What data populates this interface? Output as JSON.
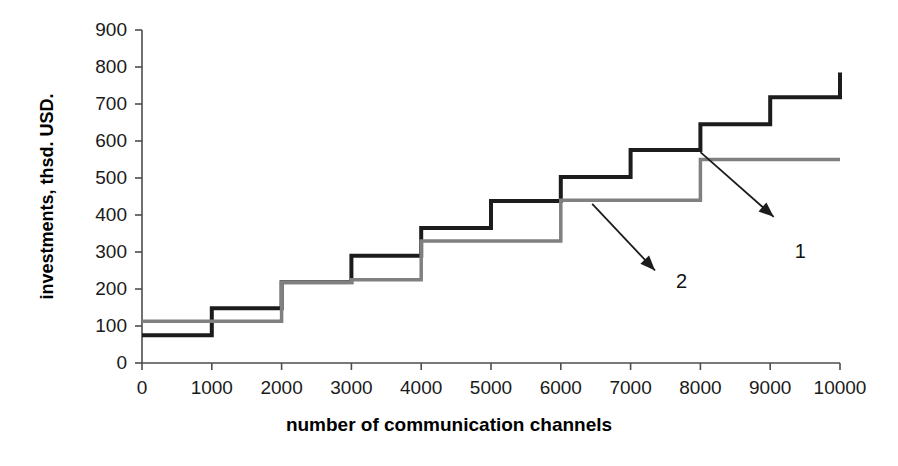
{
  "chart_data": {
    "type": "line",
    "subtype": "step",
    "title": "",
    "xlabel": "number of communication channels",
    "ylabel": "investments, thsd. USD.",
    "xlim": [
      0,
      10000
    ],
    "ylim": [
      0,
      900
    ],
    "xticks": [
      0,
      1000,
      2000,
      3000,
      4000,
      5000,
      6000,
      7000,
      8000,
      9000,
      10000
    ],
    "yticks": [
      0,
      100,
      200,
      300,
      400,
      500,
      600,
      700,
      800,
      900
    ],
    "xtick_labels": [
      "0",
      "1000",
      "2000",
      "3000",
      "4000",
      "5000",
      "6000",
      "7000",
      "8000",
      "9000",
      "10000"
    ],
    "ytick_labels": [
      "0",
      "100",
      "200",
      "300",
      "400",
      "500",
      "600",
      "700",
      "800",
      "900"
    ],
    "grid": false,
    "legend": "none",
    "step_edges": [
      0,
      1000,
      2000,
      3000,
      4000,
      5000,
      6000,
      7000,
      8000,
      9000,
      10000
    ],
    "series": [
      {
        "name": "1",
        "color": "#1c1c1c",
        "line_width": 4,
        "values": [
          75,
          148,
          218,
          290,
          365,
          438,
          503,
          576,
          645,
          718
        ],
        "end_value": 785
      },
      {
        "name": "2",
        "color": "#808080",
        "line_width": 3.5,
        "values": [
          113,
          113,
          218,
          225,
          330,
          330,
          440,
          440,
          550,
          550
        ],
        "end_value": 550
      }
    ],
    "annotations": [
      {
        "label": "1",
        "target_series": "1",
        "arrow_from": [
          8000,
          570
        ],
        "arrow_to": [
          9050,
          395
        ],
        "label_x": 9350,
        "label_y": 330
      },
      {
        "label": "2",
        "target_series": "2",
        "arrow_from": [
          6450,
          430
        ],
        "arrow_to": [
          7350,
          250
        ],
        "label_x": 7650,
        "label_y": 250
      }
    ]
  },
  "axis": {
    "color": "#4d4d4d",
    "tick_length": 7
  }
}
